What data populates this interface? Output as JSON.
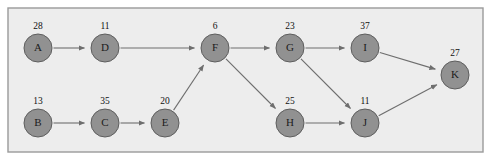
{
  "figure": {
    "name": "weighted-directed-graph",
    "panel": {
      "x": 8,
      "y": 8,
      "width": 475,
      "height": 144,
      "background": "#ededed",
      "border_color": "#9a9a9a"
    },
    "node_style": {
      "fill": "#919191",
      "stroke": "#5e5e5e",
      "radius": 14
    },
    "edge_style": {
      "stroke": "#6e6e6e",
      "arrowhead": "filled-triangle"
    }
  },
  "chart_data": {
    "type": "diagram",
    "diagram_kind": "directed-graph",
    "title": "",
    "nodes": [
      {
        "id": "A",
        "label": "A",
        "weight": 28,
        "x": 38,
        "y": 48
      },
      {
        "id": "D",
        "label": "D",
        "weight": 11,
        "x": 105,
        "y": 48
      },
      {
        "id": "F",
        "label": "F",
        "weight": 6,
        "x": 215,
        "y": 48
      },
      {
        "id": "G",
        "label": "G",
        "weight": 23,
        "x": 290,
        "y": 48
      },
      {
        "id": "I",
        "label": "I",
        "weight": 37,
        "x": 365,
        "y": 48
      },
      {
        "id": "K",
        "label": "K",
        "weight": 27,
        "x": 455,
        "y": 75
      },
      {
        "id": "B",
        "label": "B",
        "weight": 13,
        "x": 38,
        "y": 123
      },
      {
        "id": "C",
        "label": "C",
        "weight": 35,
        "x": 105,
        "y": 123
      },
      {
        "id": "E",
        "label": "E",
        "weight": 20,
        "x": 165,
        "y": 123
      },
      {
        "id": "H",
        "label": "H",
        "weight": 25,
        "x": 290,
        "y": 123
      },
      {
        "id": "J",
        "label": "J",
        "weight": 11,
        "x": 365,
        "y": 123
      }
    ],
    "edges": [
      {
        "from": "A",
        "to": "D"
      },
      {
        "from": "D",
        "to": "F"
      },
      {
        "from": "E",
        "to": "F"
      },
      {
        "from": "F",
        "to": "G"
      },
      {
        "from": "F",
        "to": "H"
      },
      {
        "from": "G",
        "to": "I"
      },
      {
        "from": "G",
        "to": "J"
      },
      {
        "from": "I",
        "to": "K"
      },
      {
        "from": "B",
        "to": "C"
      },
      {
        "from": "C",
        "to": "E"
      },
      {
        "from": "H",
        "to": "J"
      },
      {
        "from": "J",
        "to": "K"
      }
    ],
    "node_ids": [
      "A",
      "D",
      "F",
      "G",
      "I",
      "K",
      "B",
      "C",
      "E",
      "H",
      "J"
    ],
    "weights": [
      28,
      11,
      6,
      23,
      37,
      27,
      13,
      35,
      20,
      25,
      11
    ]
  }
}
